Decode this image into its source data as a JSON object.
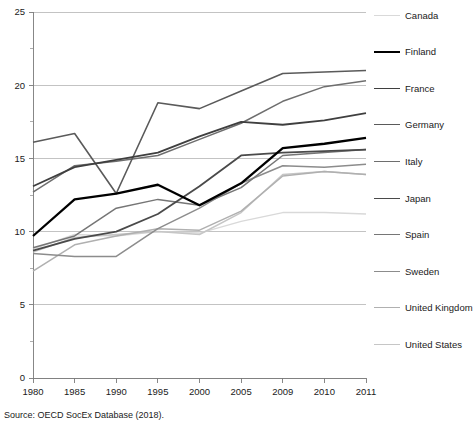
{
  "source_note": "Source: OECD SocEx Database (2018).",
  "legend": {
    "position": "right",
    "items": [
      {
        "label": "Canada",
        "color": "#d9d9d9",
        "width": 1.4
      },
      {
        "label": "Finland",
        "color": "#000000",
        "width": 2.3
      },
      {
        "label": "France",
        "color": "#3f3f3f",
        "width": 1.8
      },
      {
        "label": "Germany",
        "color": "#5a5a5a",
        "width": 1.6
      },
      {
        "label": "Italy",
        "color": "#6e6e6e",
        "width": 1.5
      },
      {
        "label": "Japan",
        "color": "#4a4a4a",
        "width": 1.8
      },
      {
        "label": "Spain",
        "color": "#767676",
        "width": 1.5
      },
      {
        "label": "Sweden",
        "color": "#8c8c8c",
        "width": 1.5
      },
      {
        "label": "United Kingdom",
        "color": "#b0b0b0",
        "width": 1.5
      },
      {
        "label": "United States",
        "color": "#c6c6c6",
        "width": 1.5
      }
    ]
  },
  "chart_data": {
    "type": "line",
    "title": "",
    "subtitle": "",
    "xlabel": "",
    "ylabel": "",
    "grid": true,
    "legend_position": "right",
    "categories": [
      "1980",
      "1985",
      "1990",
      "1995",
      "2000",
      "2005",
      "2009",
      "2010",
      "2011"
    ],
    "x": [
      1980,
      1985,
      1990,
      1995,
      2000,
      2005,
      2009,
      2010,
      2011
    ],
    "ylim": [
      0,
      25
    ],
    "yticks": [
      0,
      5,
      10,
      15,
      20,
      25
    ],
    "yminorticks": [
      2.5,
      7.5,
      12.5,
      17.5,
      22.5
    ],
    "series": [
      {
        "name": "Canada",
        "color": "#d9d9d9",
        "width": 1.4,
        "values": [
          8.8,
          9.8,
          9.7,
          10.0,
          9.9,
          10.7,
          11.3,
          11.3,
          11.2
        ]
      },
      {
        "name": "Finland",
        "color": "#000000",
        "width": 2.3,
        "values": [
          9.7,
          12.2,
          12.6,
          13.2,
          11.8,
          13.3,
          15.7,
          16.0,
          16.4
        ]
      },
      {
        "name": "France",
        "color": "#3f3f3f",
        "width": 1.8,
        "values": [
          13.1,
          14.4,
          14.9,
          15.4,
          16.5,
          17.5,
          17.3,
          17.6,
          18.1
        ]
      },
      {
        "name": "Germany",
        "color": "#5a5a5a",
        "width": 1.6,
        "values": [
          16.1,
          16.7,
          12.6,
          18.8,
          18.4,
          19.6,
          20.8,
          20.9,
          21.0
        ]
      },
      {
        "name": "Italy",
        "color": "#6e6e6e",
        "width": 1.5,
        "values": [
          12.7,
          14.5,
          14.8,
          15.2,
          16.3,
          17.4,
          18.9,
          19.9,
          20.3
        ]
      },
      {
        "name": "Japan",
        "color": "#4a4a4a",
        "width": 1.8,
        "values": [
          8.7,
          9.5,
          10.0,
          11.2,
          13.1,
          15.2,
          15.4,
          15.5,
          15.6
        ]
      },
      {
        "name": "Spain",
        "color": "#767676",
        "width": 1.5,
        "values": [
          8.9,
          9.7,
          11.6,
          12.2,
          11.8,
          13.0,
          15.2,
          15.4,
          15.6
        ]
      },
      {
        "name": "Sweden",
        "color": "#8c8c8c",
        "width": 1.5,
        "values": [
          8.5,
          8.3,
          8.3,
          10.2,
          11.6,
          13.3,
          14.5,
          14.4,
          14.6
        ]
      },
      {
        "name": "United Kingdom",
        "color": "#b0b0b0",
        "width": 1.5,
        "values": [
          7.3,
          9.1,
          9.7,
          10.2,
          10.1,
          11.4,
          13.8,
          14.1,
          13.9
        ]
      },
      {
        "name": "United States",
        "color": "#c6c6c6",
        "width": 1.5,
        "values": [
          8.6,
          9.6,
          9.8,
          10.0,
          9.8,
          11.3,
          13.9,
          14.1,
          13.9
        ]
      }
    ]
  }
}
